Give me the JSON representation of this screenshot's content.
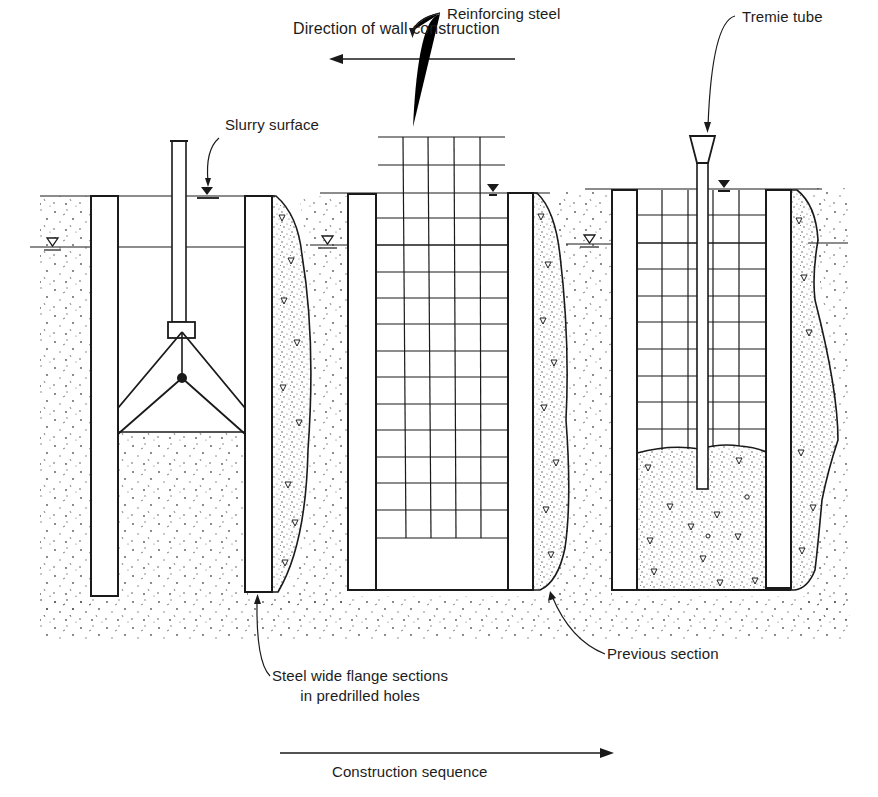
{
  "labels": {
    "direction": "Direction of wall construction",
    "reinforcing_steel": "Reinforcing steel",
    "slurry_surface": "Slurry surface",
    "tremie_tube": "Tremie tube",
    "steel_sections_line1": "Steel wide flange sections",
    "steel_sections_line2": "in predrilled holes",
    "previous_section": "Previous section",
    "sequence": "Construction sequence"
  },
  "stages": [
    {
      "id": "stage-1",
      "name": "excavation with clamshell",
      "elements": [
        "clamshell-bucket",
        "slurry-surface",
        "steel-sections",
        "previous-section-concrete"
      ]
    },
    {
      "id": "stage-2",
      "name": "reinforcing steel placement",
      "elements": [
        "reinforcing-cage",
        "slurry-surface",
        "steel-sections",
        "previous-section-concrete"
      ]
    },
    {
      "id": "stage-3",
      "name": "tremie concreting",
      "elements": [
        "tremie-tube",
        "reinforcing-cage",
        "fresh-concrete",
        "steel-sections",
        "previous-section-concrete"
      ]
    }
  ],
  "arrows": {
    "top": {
      "direction": "left"
    },
    "bottom": {
      "direction": "right"
    }
  },
  "colors": {
    "ink": "#1a1a1a",
    "paper": "#ffffff",
    "stipple": "#4a4a4a"
  }
}
